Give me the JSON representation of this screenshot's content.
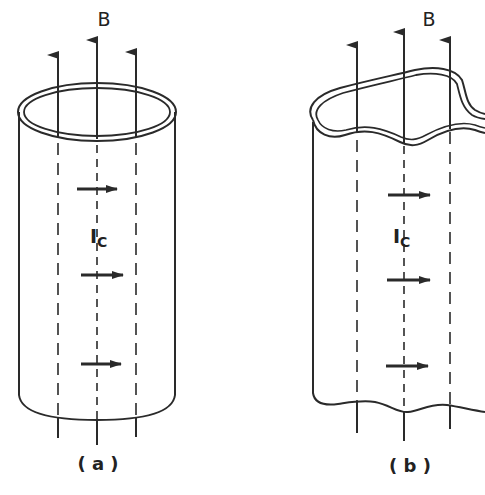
{
  "figure": {
    "panels": [
      {
        "id": "a",
        "caption": "( a )",
        "field_label": "B",
        "current_label": "I",
        "current_subscript": "C",
        "shape": "circular-cylinder"
      },
      {
        "id": "b",
        "caption": "( b )",
        "field_label": "B",
        "current_label": "I",
        "current_subscript": "C",
        "shape": "irregular-cylinder"
      }
    ],
    "colors": {
      "ink": "#2a2a2a",
      "background": "#ffffff"
    }
  }
}
